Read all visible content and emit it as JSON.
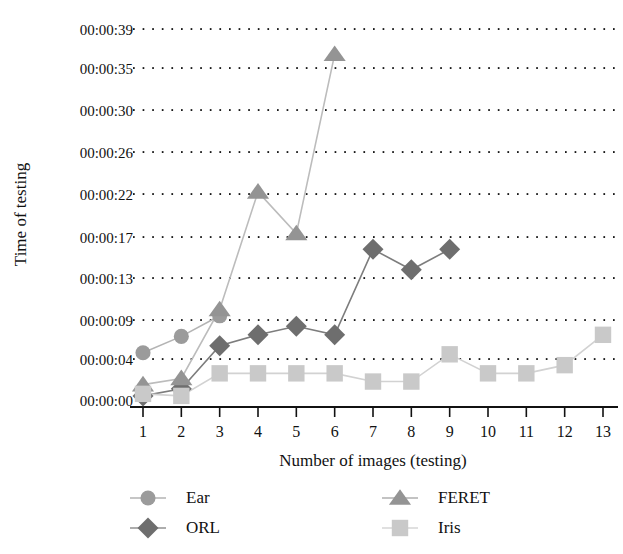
{
  "chart_data": {
    "type": "line",
    "title": "",
    "xlabel": "Number of images (testing)",
    "ylabel": "Time of testing",
    "grid": "dotted-horizontal",
    "legend_position": "bottom",
    "x": [
      1,
      2,
      3,
      4,
      5,
      6,
      7,
      8,
      9,
      10,
      11,
      12,
      13
    ],
    "xtick_labels": [
      "1",
      "2",
      "3",
      "4",
      "5",
      "6",
      "7",
      "8",
      "9",
      "10",
      "11",
      "12",
      "13"
    ],
    "ytick_labels": [
      "00:00:00",
      "00:00:04",
      "00:00:09",
      "00:00:13",
      "00:00:17",
      "00:00:22",
      "00:00:26",
      "00:00:30",
      "00:00:35",
      "00:00:39"
    ],
    "ytick_values": [
      0,
      4,
      9,
      13,
      17,
      22,
      26,
      30,
      35,
      39
    ],
    "ylim": [
      0,
      39
    ],
    "xlim": [
      1,
      13
    ],
    "series": [
      {
        "name": "Ear",
        "marker": "circle",
        "color": "#9b9b9b",
        "line_color": "#b4b4b4",
        "x": [
          1,
          2,
          3
        ],
        "values": [
          4.8,
          6.9,
          9.4
        ]
      },
      {
        "name": "ORL",
        "marker": "diamond",
        "color": "#6e6e6e",
        "line_color": "#7d7d7d",
        "x": [
          1,
          2,
          3,
          4,
          5,
          6,
          7,
          8,
          9
        ],
        "values": [
          0.4,
          1.1,
          5.7,
          7.1,
          8.2,
          7.1,
          15.8,
          13.8,
          15.8
        ]
      },
      {
        "name": "FERET",
        "marker": "triangle",
        "color": "#949494",
        "line_color": "#bcbcbc",
        "x": [
          1,
          2,
          3,
          4,
          5,
          6
        ],
        "values": [
          1.5,
          2.1,
          10.0,
          22.2,
          17.4,
          36.4
        ]
      },
      {
        "name": "Iris",
        "marker": "square",
        "color": "#c9c9c9",
        "line_color": "#d2d2d2",
        "x": [
          1,
          2,
          3,
          4,
          5,
          6,
          7,
          8,
          9,
          10,
          11,
          12,
          13
        ],
        "values": [
          0.6,
          0.4,
          2.6,
          2.6,
          2.6,
          2.6,
          1.8,
          1.8,
          4.6,
          2.6,
          2.6,
          3.4,
          7.1
        ]
      }
    ],
    "legend": [
      {
        "label": "Ear",
        "marker": "circle",
        "color": "#9b9b9b"
      },
      {
        "label": "FERET",
        "marker": "triangle",
        "color": "#949494"
      },
      {
        "label": "ORL",
        "marker": "diamond",
        "color": "#6e6e6e"
      },
      {
        "label": "Iris",
        "marker": "square",
        "color": "#c9c9c9"
      }
    ]
  }
}
